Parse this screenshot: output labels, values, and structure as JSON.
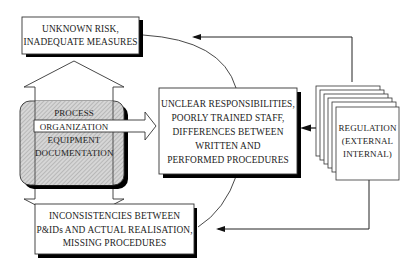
{
  "diagram": {
    "boxes": {
      "unknown_risk": {
        "lines": [
          "UNKNOWN RISK,",
          "INADEQUATE MEASURES"
        ]
      },
      "central": {
        "lines": [
          "UNCLEAR RESPONSIBILITIES,",
          "POORLY TRAINED STAFF,",
          "DIFFERENCES BETWEEN",
          "WRITTEN AND",
          "PERFORMED PROCEDURES"
        ]
      },
      "inconsistencies": {
        "lines": [
          "INCONSISTENCIES BETWEEN",
          "P&IDs AND ACTUAL REALISATION,",
          "MISSING PROCEDURES"
        ]
      },
      "factors": {
        "lines": [
          "PROCESS",
          "ORGANIZATION",
          "EQUIPMENT",
          "DOCUMENTATION"
        ]
      },
      "regulation": {
        "lines": [
          "REGULATION",
          "(EXTERNAL",
          "INTERNAL)"
        ]
      }
    },
    "colors": {
      "stroke": "#222222",
      "shadow": "#000000",
      "hatch_fill": "#cfcfcf",
      "background": "#ffffff"
    },
    "connections": [
      {
        "from": "regulation",
        "to": "unknown_risk",
        "type": "elbow-arrow"
      },
      {
        "from": "regulation",
        "to": "central",
        "type": "arrow"
      },
      {
        "from": "regulation",
        "to": "inconsistencies",
        "type": "elbow-arrow"
      },
      {
        "from": "factors",
        "to": "central",
        "type": "block-arrow"
      },
      {
        "from": "factors",
        "to": "unknown_risk",
        "type": "block-arrow"
      },
      {
        "from": "factors",
        "to": "inconsistencies",
        "type": "block-arrow"
      },
      {
        "from": "unknown_risk",
        "to": "central",
        "type": "curve"
      },
      {
        "from": "central",
        "to": "inconsistencies",
        "type": "curve"
      }
    ]
  }
}
